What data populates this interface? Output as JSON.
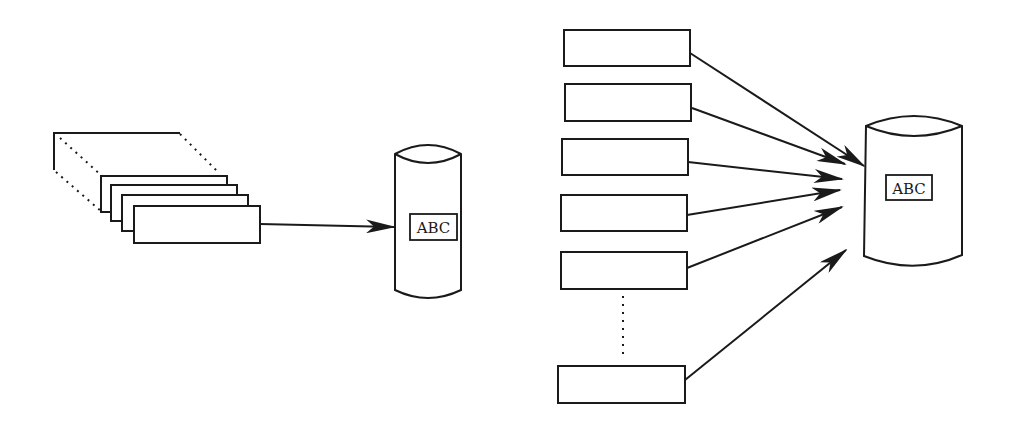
{
  "diagram": {
    "left_panel": {
      "source": "stack-of-records",
      "database_label": "ABC"
    },
    "right_panel": {
      "sources_count_visible": 6,
      "ellipsis": "vertical-dots",
      "database_label": "ABC"
    },
    "colors": {
      "stroke": "#1a1a1a",
      "background": "#ffffff"
    }
  }
}
